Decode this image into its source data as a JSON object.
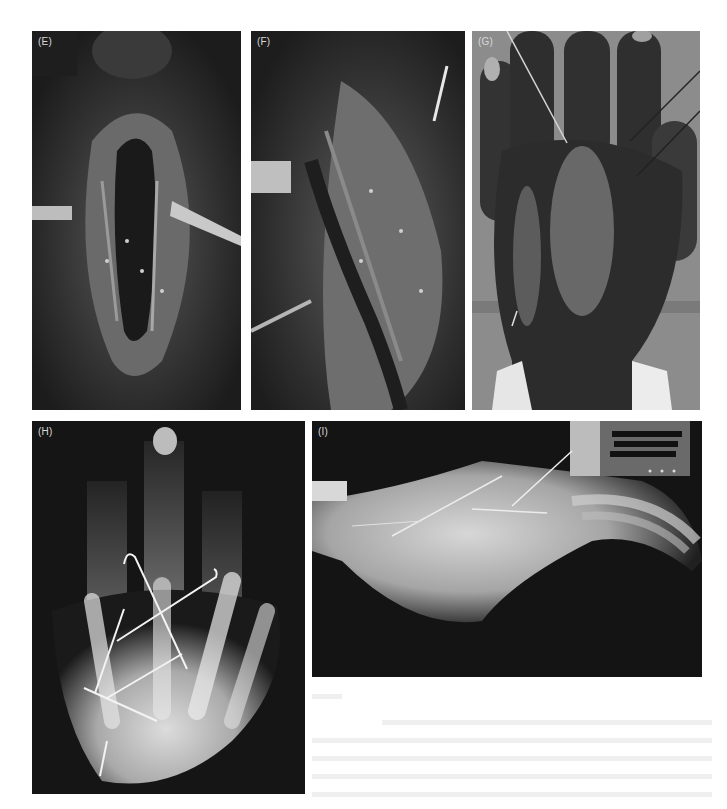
{
  "figure": {
    "panels": [
      {
        "id": "E",
        "label": "(E)",
        "type": "clinical-photo",
        "subject": "open surgical wound with retractors"
      },
      {
        "id": "F",
        "label": "(F)",
        "type": "clinical-photo",
        "subject": "open surgical wound, retracted tissue"
      },
      {
        "id": "G",
        "label": "(G)",
        "type": "clinical-photo",
        "subject": "dorsum of hand with K-wires and incisions"
      },
      {
        "id": "H",
        "label": "(H)",
        "type": "x-ray",
        "subject": "PA radiograph of hand with crossed K-wires"
      },
      {
        "id": "I",
        "label": "(I)",
        "type": "x-ray",
        "subject": "lateral radiograph of hand with K-wires"
      }
    ],
    "colors": {
      "background": "#ffffff",
      "label": "#d8d8d8",
      "photo_dark": "#2a2a2a",
      "xray_bone": "#d9d9d9",
      "xray_dark": "#141414",
      "wire": "#f0f0f0"
    }
  }
}
